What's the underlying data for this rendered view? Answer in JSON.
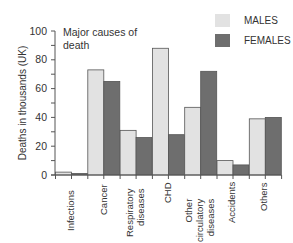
{
  "chart_data": {
    "type": "bar",
    "title": "Major causes of death",
    "xlabel": "",
    "ylabel": "Deaths in thousands (UK)",
    "ylim": [
      0,
      100
    ],
    "yticks": [
      0,
      20,
      40,
      60,
      80,
      100
    ],
    "grid": false,
    "legend_position": "top-right",
    "categories": [
      "Infections",
      "Cancer",
      "Respiratory diseases",
      "CHD",
      "Other circulatory diseases",
      "Accidents",
      "Others"
    ],
    "series": [
      {
        "name": "MALES",
        "color": "#e2e2e2",
        "values": [
          2,
          73,
          31,
          88,
          47,
          10,
          39
        ]
      },
      {
        "name": "FEMALES",
        "color": "#6e6e6e",
        "values": [
          1,
          65,
          26,
          28,
          72,
          7,
          40
        ]
      }
    ]
  },
  "labels": {
    "title_line1": "Major causes of",
    "title_line2": "death",
    "ylabel": "Deaths in thousands (UK)",
    "legend_males": "MALES",
    "legend_females": "FEMALES",
    "cat0": "Infections",
    "cat1": "Cancer",
    "cat2": "Respiratory\ndiseases",
    "cat3": "CHD",
    "cat4": "Other\ncirculatory\ndiseases",
    "cat5": "Accidents",
    "cat6": "Others"
  }
}
